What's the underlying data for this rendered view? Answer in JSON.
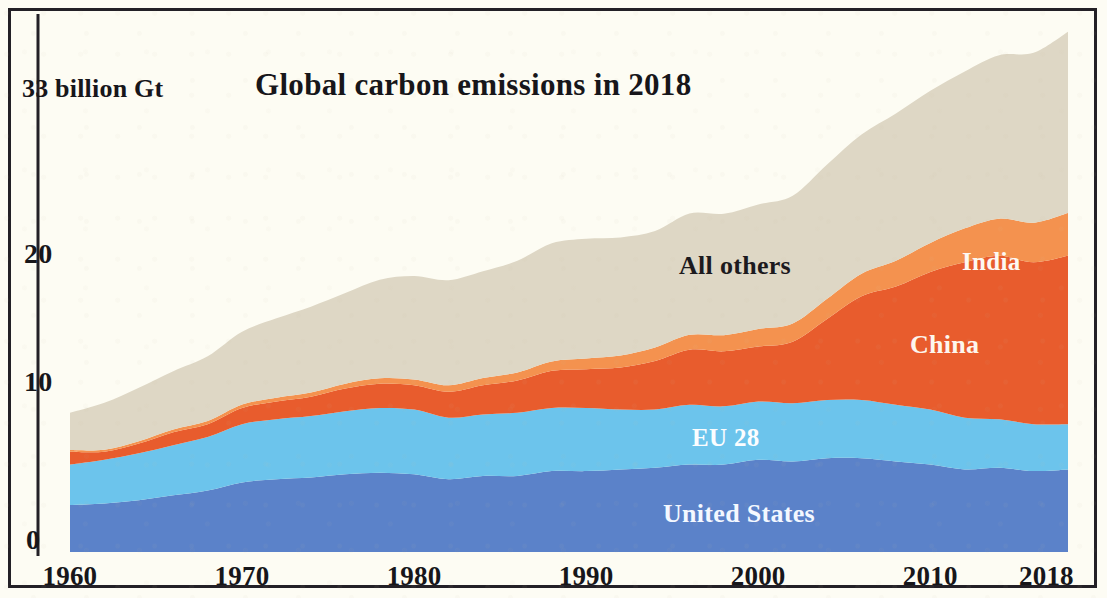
{
  "chart_data": {
    "type": "area",
    "stacked": true,
    "title": "Global carbon emissions in 2018",
    "xlabel": "",
    "ylabel": "33 billion Gt",
    "ytick_labels": [
      "0",
      "10",
      "20"
    ],
    "ytick_values": [
      0,
      10,
      20
    ],
    "ylim": [
      0,
      33
    ],
    "xlim": [
      1960,
      2018
    ],
    "xtick_labels": [
      "1960",
      "1970",
      "1980",
      "1990",
      "2000",
      "2010",
      "2018"
    ],
    "xtick_values": [
      1960,
      1970,
      1980,
      1990,
      2000,
      2010,
      2018
    ],
    "grid": false,
    "legend_position": "inline-annotations",
    "units": "billion tonnes CO2 (Gt)",
    "x": [
      1960,
      1962,
      1964,
      1966,
      1968,
      1970,
      1972,
      1974,
      1976,
      1978,
      1980,
      1982,
      1984,
      1986,
      1988,
      1990,
      1992,
      1994,
      1996,
      1998,
      2000,
      2002,
      2004,
      2006,
      2008,
      2010,
      2012,
      2014,
      2016,
      2018
    ],
    "series": [
      {
        "name": "United States",
        "color": "#5b82c9",
        "label_color": "#f4f8ff",
        "values": [
          2.9,
          3.0,
          3.2,
          3.5,
          3.8,
          4.3,
          4.5,
          4.6,
          4.8,
          4.9,
          4.8,
          4.5,
          4.7,
          4.7,
          5.0,
          5.0,
          5.1,
          5.2,
          5.4,
          5.4,
          5.7,
          5.6,
          5.8,
          5.8,
          5.6,
          5.4,
          5.1,
          5.2,
          5.0,
          5.1
        ]
      },
      {
        "name": "EU 28",
        "color": "#6cc4ec",
        "label_color": "#fbfdff",
        "values": [
          2.5,
          2.7,
          2.9,
          3.1,
          3.3,
          3.6,
          3.7,
          3.8,
          3.9,
          4.0,
          4.0,
          3.8,
          3.8,
          3.9,
          3.9,
          3.9,
          3.7,
          3.6,
          3.7,
          3.6,
          3.6,
          3.6,
          3.6,
          3.6,
          3.5,
          3.4,
          3.2,
          3.0,
          2.9,
          2.8
        ]
      },
      {
        "name": "China",
        "color": "#e85c2d",
        "label_color": "#fdf6ee",
        "values": [
          0.8,
          0.5,
          0.6,
          0.8,
          0.8,
          1.0,
          1.1,
          1.2,
          1.4,
          1.5,
          1.5,
          1.6,
          1.8,
          2.0,
          2.3,
          2.4,
          2.6,
          3.0,
          3.4,
          3.4,
          3.4,
          3.8,
          5.0,
          6.4,
          7.3,
          8.5,
          9.6,
          10.1,
          10.0,
          10.4
        ]
      },
      {
        "name": "India",
        "color": "#f4924f",
        "label_color": "#fdf8f2",
        "values": [
          0.1,
          0.12,
          0.15,
          0.17,
          0.19,
          0.21,
          0.24,
          0.26,
          0.3,
          0.33,
          0.36,
          0.4,
          0.45,
          0.5,
          0.58,
          0.66,
          0.74,
          0.83,
          0.92,
          1.0,
          1.08,
          1.12,
          1.25,
          1.4,
          1.6,
          1.8,
          2.1,
          2.3,
          2.45,
          2.65
        ]
      },
      {
        "name": "All others",
        "color": "#ded7c5",
        "label_color": "#1c1a1e",
        "values": [
          2.3,
          2.9,
          3.3,
          3.6,
          4.0,
          4.5,
          4.9,
          5.3,
          5.6,
          6.1,
          6.4,
          6.5,
          6.6,
          6.9,
          7.3,
          7.4,
          7.3,
          7.2,
          7.5,
          7.5,
          7.7,
          7.9,
          8.3,
          8.6,
          9.1,
          9.4,
          9.7,
          10.1,
          10.5,
          11.2
        ]
      }
    ],
    "totals": [
      8.6,
      9.2,
      10.15,
      11.17,
      12.09,
      13.61,
      14.44,
      15.16,
      16.0,
      16.83,
      17.06,
      16.8,
      17.35,
      18.0,
      19.08,
      19.36,
      19.44,
      19.83,
      20.92,
      20.9,
      21.48,
      22.02,
      23.95,
      25.8,
      27.1,
      28.5,
      29.7,
      30.7,
      30.85,
      32.15
    ]
  },
  "axis": {
    "y_top_label": "33 billion Gt",
    "y_tick_20": "20",
    "y_tick_10": "10",
    "y_tick_0": "0",
    "x_tick_1960": "1960",
    "x_tick_1970": "1970",
    "x_tick_1980": "1980",
    "x_tick_1990": "1990",
    "x_tick_2000": "2000",
    "x_tick_2010": "2010",
    "x_tick_2018": "2018"
  },
  "labels": {
    "title": "Global carbon emissions in 2018",
    "all_others": "All others",
    "india": "India",
    "china": "China",
    "eu28": "EU 28",
    "united_states": "United States"
  },
  "colors": {
    "united_states": "#5b82c9",
    "eu28": "#6cc4ec",
    "china": "#e85c2d",
    "india": "#f4924f",
    "all_others": "#ded7c5",
    "background": "#fdfcf3",
    "frame": "#232026",
    "text": "#17161a"
  }
}
